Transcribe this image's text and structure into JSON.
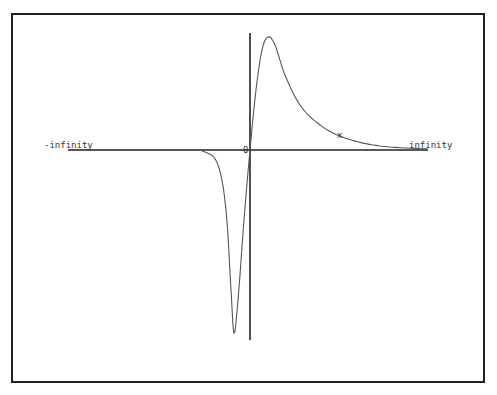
{
  "chart_data": {
    "type": "line",
    "title": "",
    "xlabel": "x",
    "ylabel": "",
    "x_axis_left_label": "-infinity",
    "x_axis_right_label": "infinity",
    "origin_label": "0",
    "grid": false,
    "legend": null,
    "series": [
      {
        "name": "f(x)",
        "description": "odd-like curve: flat near 0 for large negative x, sharp dip to minimum left of origin, passes through origin, peak right of origin, decays to 0 toward +infinity",
        "points_px": [
          [
            68,
            150
          ],
          [
            180,
            150
          ],
          [
            205,
            152
          ],
          [
            218,
            165
          ],
          [
            226,
            210
          ],
          [
            231,
            290
          ],
          [
            234,
            333
          ],
          [
            238,
            300
          ],
          [
            244,
            220
          ],
          [
            250,
            150
          ],
          [
            256,
            90
          ],
          [
            262,
            50
          ],
          [
            268,
            37
          ],
          [
            275,
            45
          ],
          [
            285,
            75
          ],
          [
            300,
            105
          ],
          [
            320,
            125
          ],
          [
            345,
            138
          ],
          [
            380,
            146
          ],
          [
            428,
            149
          ]
        ],
        "features": {
          "minimum_px": [
            234,
            333
          ],
          "maximum_px": [
            268,
            37
          ],
          "origin_px": [
            250,
            150
          ]
        }
      }
    ]
  },
  "colors": {
    "axis": "#222222",
    "curve": "#555555",
    "frame": "#222222"
  }
}
